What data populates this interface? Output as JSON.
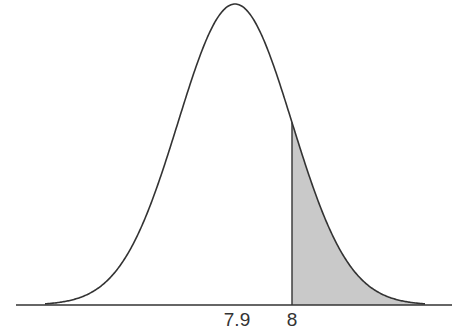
{
  "diagram": {
    "type": "normal-distribution-shaded-tail",
    "mean": 7.9,
    "sd": 0.1,
    "shaded_from": 8,
    "shaded_side": "right",
    "tick_labels": [
      {
        "value": 7.9,
        "text": "7.9"
      },
      {
        "value": 8,
        "text": "8"
      }
    ],
    "colors": {
      "curve": "#333333",
      "axis": "#333333",
      "shade": "#c9c9c9",
      "cutoff_line": "#333333"
    }
  }
}
